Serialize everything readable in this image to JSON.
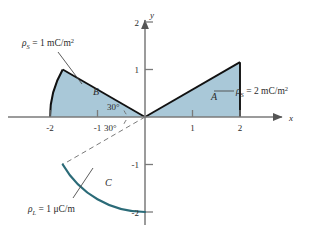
{
  "figure": {
    "background": "#ffffff",
    "fill_color": "#a9c8d8",
    "outline_color": "#111111",
    "curve_color": "#2b6b78",
    "axis_color": "#7a7a7a",
    "text_color": "#2b2b2b"
  },
  "axes": {
    "x_label": "x",
    "y_label": "y",
    "x_ticks": [
      "-2",
      "-1",
      "1",
      "2"
    ],
    "y_ticks": [
      "2",
      "1",
      "-1",
      "-2"
    ],
    "x_range": [
      -2.6,
      2.6
    ],
    "y_range": [
      -2.5,
      2.5
    ],
    "grid": false
  },
  "angles": {
    "upper_label": "30°",
    "lower_label": "30°"
  },
  "regions": [
    {
      "id": "A",
      "label": "A",
      "type": "sector",
      "radius": 2,
      "angle_start_deg": 0,
      "angle_end_deg": 30,
      "annotation": {
        "rho": "ρ",
        "subscript": "S",
        "equals": "= 2 mC/m",
        "exponent": "2",
        "full": "ρS = 2 mC/m2"
      }
    },
    {
      "id": "B",
      "label": "B",
      "type": "sector",
      "radius": 2,
      "angle_start_deg": 150,
      "angle_end_deg": 180,
      "annotation": {
        "rho": "ρ",
        "subscript": "S",
        "equals": "= 1 mC/m",
        "exponent": "2",
        "full": "ρS = 1 mC/m2"
      }
    },
    {
      "id": "C",
      "label": "C",
      "type": "arc",
      "radius": 2,
      "angle_start_deg": 210,
      "angle_end_deg": 270,
      "annotation": {
        "rho": "ρ",
        "subscript": "L",
        "equals": "= 1 μC/m",
        "exponent": "",
        "full": "ρL = 1 μC/m"
      }
    }
  ],
  "dashed_ray": {
    "angle_deg": -30,
    "length": 2
  }
}
